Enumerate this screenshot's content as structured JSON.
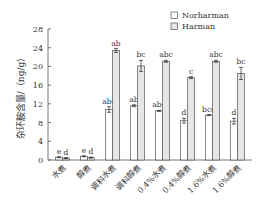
{
  "chart_data": {
    "type": "bar",
    "title": "",
    "xlabel": "",
    "ylabel": "杂环胺含量/（ng/g）",
    "ylim": [
      0,
      28
    ],
    "yticks": [
      0,
      4,
      8,
      12,
      16,
      20,
      24,
      28
    ],
    "grid": false,
    "legend_position": "top-right",
    "categories": [
      "水煮",
      "醇煮",
      "调料水煮",
      "调料醇煮",
      "0.4%水煮",
      "0.4%醇煮",
      "1.6%水煮",
      "1.6%醇煮"
    ],
    "series": [
      {
        "name": "Norharman",
        "color": "#ffffff",
        "values": [
          0.6,
          0.8,
          10.8,
          11.6,
          10.5,
          8.4,
          9.6,
          8.3
        ],
        "errors": [
          0.1,
          0.1,
          0.6,
          0.2,
          0.1,
          0.5,
          0.1,
          0.6
        ],
        "significance": [
          "e",
          "e",
          "abc",
          "ab",
          "abc",
          "d",
          "bcd",
          "d"
        ]
      },
      {
        "name": "Harman",
        "color": "#e6e6e6",
        "values": [
          0.4,
          0.5,
          23.4,
          20.1,
          21.1,
          17.6,
          21.1,
          18.5
        ],
        "errors": [
          0.1,
          0.1,
          0.4,
          1.2,
          0.2,
          0.2,
          0.2,
          1.3
        ],
        "significance": [
          "d",
          "d",
          "ab",
          "bc",
          "abc",
          "c",
          "abc",
          "bc"
        ]
      }
    ]
  }
}
